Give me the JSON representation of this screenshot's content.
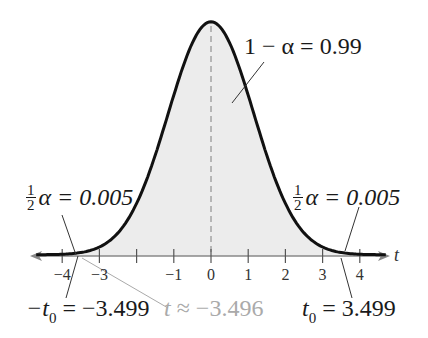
{
  "diagram": {
    "type": "t-distribution",
    "axis_variable": "t",
    "x_range": [
      -4.5,
      4.5
    ],
    "ticks": [
      -4,
      -3,
      -2,
      -1,
      0,
      1,
      2,
      3,
      4
    ],
    "tick_labels": [
      "−4",
      "−3",
      "",
      "−1",
      "0",
      "1",
      "2",
      "3",
      "4"
    ],
    "center_label": "1 − α = 0.99",
    "left_tail": {
      "fraction_num": "1",
      "fraction_den": "2",
      "label": "α = 0.005",
      "critical_prefix": "−t",
      "critical_sub": "0",
      "critical_value": " = −3.499"
    },
    "right_tail": {
      "fraction_num": "1",
      "fraction_den": "2",
      "label": "α = 0.005",
      "critical_prefix": "t",
      "critical_sub": "0",
      "critical_value": " = 3.499"
    },
    "test_statistic": {
      "symbol": "t",
      "text": " ≈ −3.496",
      "value": -3.496
    },
    "colors": {
      "curve": "#111111",
      "fill": "#ececec",
      "axis": "#888888",
      "dashed_center": "#999999",
      "test_statistic": "#aaaaaa",
      "leader_lines": "#333333"
    }
  },
  "chart_data": {
    "type": "area",
    "title": "",
    "xlabel": "t",
    "ylabel": "",
    "xlim": [
      -4.5,
      4.5
    ],
    "x_ticks": [
      -4,
      -3,
      -2,
      -1,
      0,
      1,
      2,
      3,
      4
    ],
    "confidence_level": 0.99,
    "alpha": 0.01,
    "tail_area_each": 0.005,
    "critical_values": [
      -3.499,
      3.499
    ],
    "test_statistic": -3.496,
    "annotations": [
      "1 − α = 0.99",
      "½α = 0.005",
      "½α = 0.005",
      "−t0 = −3.499",
      "t0 = 3.499",
      "t ≈ −3.496"
    ],
    "grid": false
  }
}
